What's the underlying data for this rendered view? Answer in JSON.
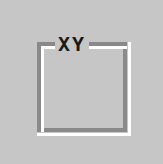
{
  "groupbox": {
    "legend": "XY"
  },
  "colors": {
    "background": "#c6c6c6",
    "border_dark": "#8a8a8a",
    "border_light": "#ffffff",
    "text": "#1a1a1a"
  }
}
